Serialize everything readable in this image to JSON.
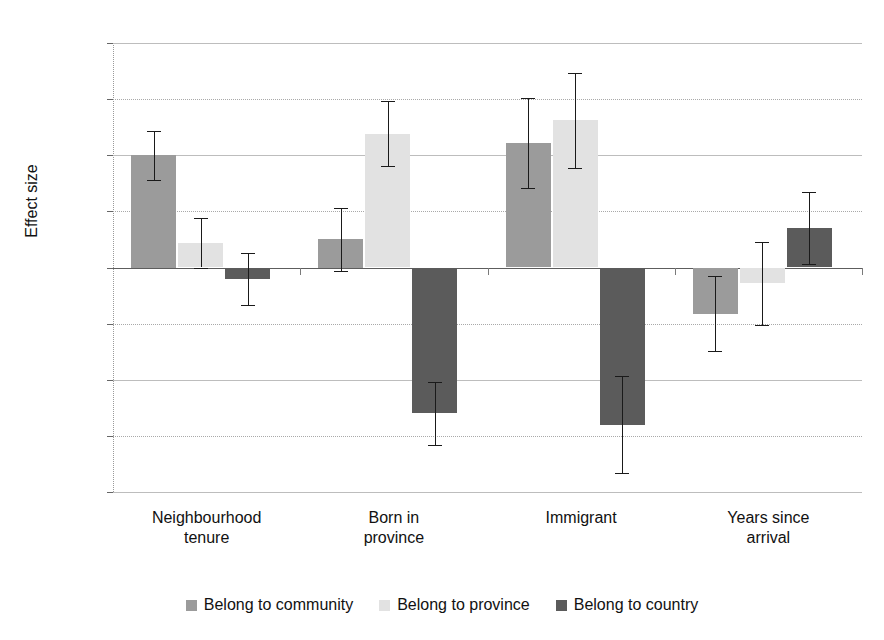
{
  "chart_data": {
    "type": "bar",
    "title": "",
    "xlabel": "",
    "ylabel": "Effect size",
    "ylim": [
      -0.2,
      0.2
    ],
    "ytick_labels": [
      "0.20",
      "0.15",
      "0.10",
      "0.05",
      "0.00",
      "-0.05",
      "-0.10",
      "-0.15",
      "-0.20"
    ],
    "ytick_values": [
      0.2,
      0.15,
      0.1,
      0.05,
      0.0,
      -0.05,
      -0.1,
      -0.15,
      -0.2
    ],
    "grid": true,
    "legend_position": "bottom",
    "categories": [
      "Neighbourhood tenure",
      "Born in province",
      "Immigrant",
      "Years since arrival"
    ],
    "category_lines": [
      [
        "Neighbourhood",
        "tenure"
      ],
      [
        "Born in",
        "province"
      ],
      [
        "Immigrant",
        ""
      ],
      [
        "Years since",
        "arrival"
      ]
    ],
    "series": [
      {
        "name": "Belong to community",
        "color": "#9b9b9b",
        "values": [
          0.1,
          0.025,
          0.111,
          -0.041
        ],
        "errors": [
          0.022,
          0.028,
          0.04,
          0.033
        ]
      },
      {
        "name": "Belong to province",
        "color": "#e2e2e2",
        "values": [
          0.022,
          0.119,
          0.131,
          -0.014
        ],
        "errors": [
          0.022,
          0.029,
          0.042,
          0.037
        ]
      },
      {
        "name": "Belong to country",
        "color": "#5b5b5b",
        "values": [
          -0.01,
          -0.13,
          -0.14,
          0.035
        ],
        "errors": [
          0.023,
          0.028,
          0.043,
          0.032
        ]
      }
    ]
  },
  "axis": {
    "y_title": "Effect size"
  },
  "legend": {
    "items": [
      {
        "label": "Belong to community",
        "color": "#9b9b9b"
      },
      {
        "label": "Belong to province",
        "color": "#e2e2e2"
      },
      {
        "label": "Belong to country",
        "color": "#5b5b5b"
      }
    ]
  },
  "title_sliver": ""
}
